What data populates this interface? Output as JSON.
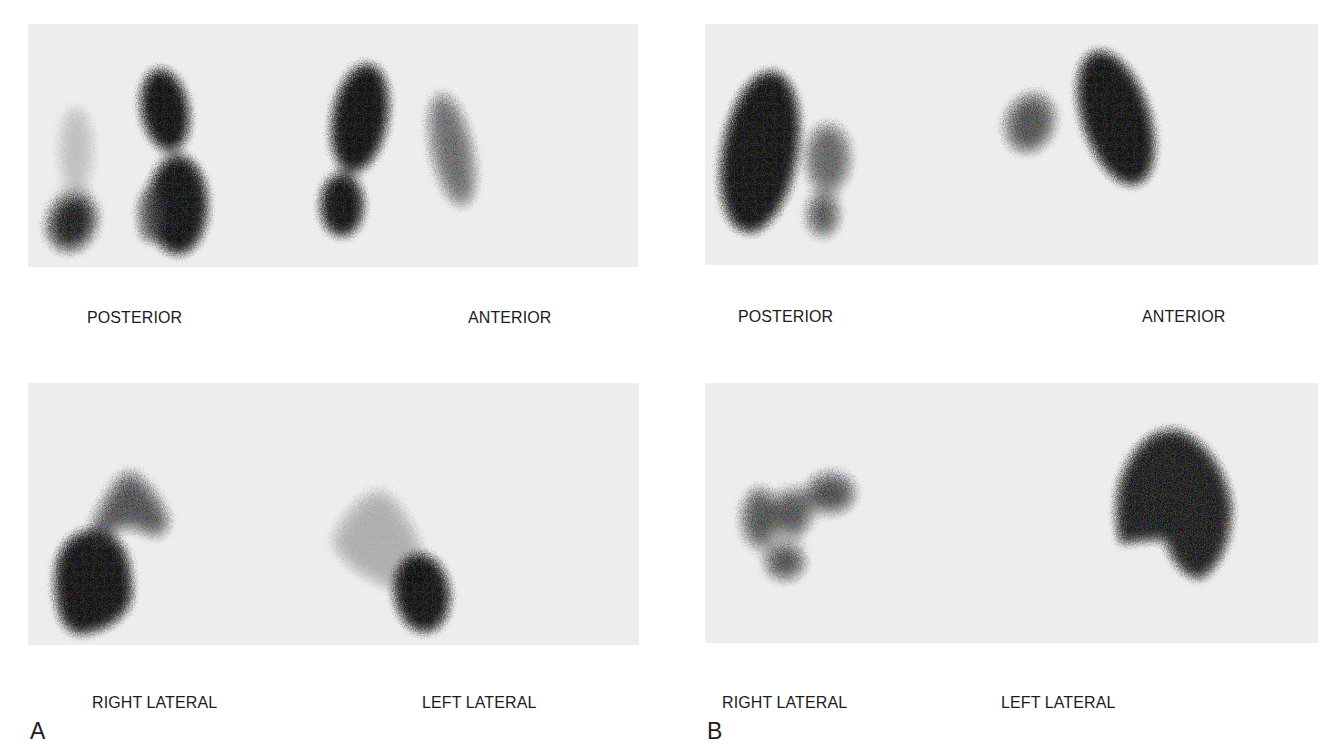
{
  "figure": {
    "panels": [
      {
        "letter": "A",
        "views": [
          {
            "id": "a-posterior",
            "label": "POSTERIOR"
          },
          {
            "id": "a-anterior",
            "label": "ANTERIOR"
          },
          {
            "id": "a-right-lateral",
            "label": "RIGHT LATERAL"
          },
          {
            "id": "a-left-lateral",
            "label": "LEFT LATERAL"
          }
        ]
      },
      {
        "letter": "B",
        "views": [
          {
            "id": "b-posterior",
            "label": "POSTERIOR"
          },
          {
            "id": "b-anterior",
            "label": "ANTERIOR"
          },
          {
            "id": "b-right-lateral",
            "label": "RIGHT LATERAL"
          },
          {
            "id": "b-left-lateral",
            "label": "LEFT LATERAL"
          }
        ]
      }
    ],
    "colors": {
      "page_background": "#ffffff",
      "scan_background": "#ededed",
      "uptake_dark": "#151515",
      "label_text": "#1c1c1c"
    }
  }
}
